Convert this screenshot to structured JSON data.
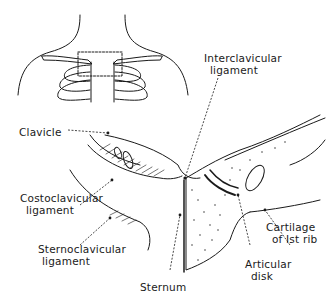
{
  "figure": {
    "inset": {
      "description": "Shoulder and upper rib cage outline with dashed rectangle marking enlarged region"
    },
    "labels": {
      "interclavicular_line1": "Interclavicular",
      "interclavicular_line2": "ligament",
      "clavicle": "Clavicle",
      "costoclavicular_line1": "Costoclavicular",
      "costoclavicular_line2": "ligament",
      "sternoclavicular_line1": "Sternoclavicular",
      "sternoclavicular_line2": "ligament",
      "sternum": "Sternum",
      "articular_line1": "Articular",
      "articular_line2": "disk",
      "cartilage_line1": "Cartilage",
      "cartilage_line2": "of Ist rib"
    },
    "colors": {
      "ink": "#1a1a1a",
      "background": "#ffffff"
    }
  }
}
